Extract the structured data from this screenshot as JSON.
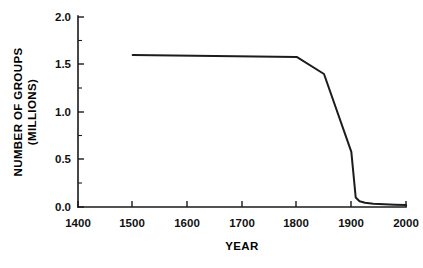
{
  "chart_data": {
    "type": "line",
    "title": "",
    "xlabel": "YEAR",
    "ylabel": "NUMBER OF GROUPS (MILLIONS)",
    "ylabel_line1": "NUMBER OF GROUPS",
    "ylabel_line2": "(MILLIONS)",
    "xlim": [
      1400,
      2000
    ],
    "ylim": [
      0.0,
      2.0
    ],
    "xticks": [
      1400,
      1500,
      1600,
      1700,
      1800,
      1900,
      2000
    ],
    "xtick_labels": [
      "1400",
      "1500",
      "1600",
      "1700",
      "1800",
      "1900",
      "2000"
    ],
    "yticks": [
      0.0,
      0.5,
      1.0,
      1.5,
      2.0
    ],
    "ytick_labels": [
      "0.0",
      "0.5",
      "1.0",
      "1.5",
      "2.0"
    ],
    "y_minor_ticks": [
      0.25,
      0.75,
      1.25,
      1.75
    ],
    "grid": false,
    "legend": false,
    "line_color": "#1c1c1c",
    "series": [
      {
        "name": "Number of groups",
        "x": [
          1500,
          1800,
          1850,
          1900,
          1908,
          1915,
          1925,
          1940,
          1960,
          1980,
          2000
        ],
        "y": [
          1.6,
          1.58,
          1.4,
          0.58,
          0.1,
          0.06,
          0.045,
          0.035,
          0.03,
          0.025,
          0.02
        ]
      }
    ],
    "annotations": []
  },
  "axes": {
    "x_axis_name": "year-axis",
    "y_axis_name": "number-of-groups-axis"
  }
}
